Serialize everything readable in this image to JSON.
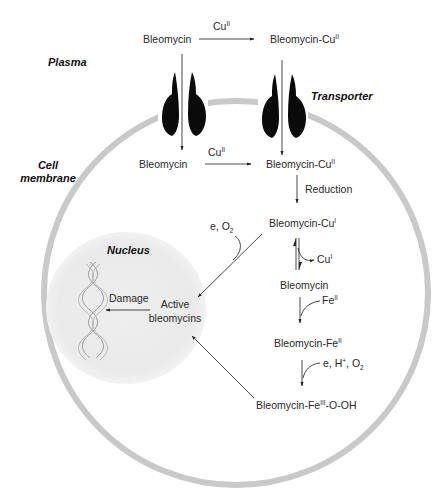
{
  "diagram": {
    "regions": {
      "plasma": "Plasma",
      "transporter": "Transporter",
      "cell_membrane_line1": "Cell",
      "cell_membrane_line2": "membrane",
      "nucleus": "Nucleus"
    },
    "colors": {
      "membrane": "#c9c9c9",
      "nucleus_fill": "#ececec",
      "transporter": "#0a0a0a",
      "arrow": "#333333",
      "text": "#2a2a2a"
    },
    "plasma_row": {
      "left_species": "Bleomycin",
      "reagent_base": "Cu",
      "reagent_ox": "II",
      "right_species_base": "Bleomycin-Cu",
      "right_species_ox": "II"
    },
    "cytosol_row": {
      "left_species": "Bleomycin",
      "reagent_base": "Cu",
      "reagent_ox": "II",
      "right_species_base": "Bleomycin-Cu",
      "right_species_ox": "II"
    },
    "pathway": {
      "reduction_label": "Reduction",
      "cu1_species_base": "Bleomycin-Cu",
      "cu1_species_ox": "I",
      "cu1_release_base": "Cu",
      "cu1_release_ox": "I",
      "free_bleomycin": "Bleomycin",
      "fe_reagent_base": "Fe",
      "fe_reagent_ox": "II",
      "fe2_species_base": "Bleomycin-Fe",
      "fe2_species_ox": "II",
      "activation_reagents_prefix": "e, H",
      "activation_reagents_plus": "+",
      "activation_reagents_mid": ", O",
      "activation_reagents_sub": "2",
      "peroxide_species_base": "Bleomycin-Fe",
      "peroxide_species_ox": "III",
      "peroxide_species_tail": "-O-OH",
      "oxidation_reagents_prefix": "e, O",
      "oxidation_reagents_sub": "2"
    },
    "nucleus_content": {
      "damage_label": "Damage",
      "active_line1": "Active",
      "active_line2": "bleomycins"
    }
  }
}
